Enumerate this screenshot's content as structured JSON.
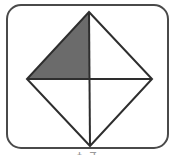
{
  "figure": {
    "canvas": {
      "width": 174,
      "height": 165,
      "background": "#ffffff"
    },
    "frame": {
      "name": "rounded-rectangle-frame",
      "x": 7,
      "y": 5,
      "width": 161,
      "height": 143,
      "corner_radius": 14,
      "stroke_color": "#4a4a4a",
      "stroke_width": 2,
      "fill_color": "#ffffff"
    },
    "diamond": {
      "name": "diamond-outline",
      "stroke_color": "#2e2e2e",
      "stroke_width": 2,
      "fill_color": "#ffffff",
      "vertices": {
        "top": {
          "x": 89,
          "y": 12
        },
        "right": {
          "x": 152,
          "y": 79
        },
        "bottom": {
          "x": 90,
          "y": 146
        },
        "left": {
          "x": 27,
          "y": 79
        }
      },
      "center": {
        "x": 89,
        "y": 79
      }
    },
    "divider_lines": [
      {
        "name": "horizontal-divider",
        "orientation": "horizontal",
        "from": {
          "x": 27,
          "y": 79
        },
        "to": {
          "x": 152,
          "y": 79
        },
        "stroke_color": "#2e2e2e",
        "stroke_width": 2
      },
      {
        "name": "vertical-divider",
        "orientation": "vertical",
        "from": {
          "x": 89,
          "y": 12
        },
        "to": {
          "x": 90,
          "y": 146
        },
        "stroke_color": "#2e2e2e",
        "stroke_width": 2
      }
    ],
    "quadrants": [
      {
        "name": "quadrant-upper-left",
        "position": "upper-left",
        "shaded": true,
        "fill_color": "#6b6b6b",
        "points": "89,12 89,79 27,79"
      },
      {
        "name": "quadrant-upper-right",
        "position": "upper-right",
        "shaded": false,
        "fill_color": "#ffffff",
        "points": "89,12 152,79 89,79"
      },
      {
        "name": "quadrant-lower-right",
        "position": "lower-right",
        "shaded": false,
        "fill_color": "#ffffff",
        "points": "89,79 152,79 90,146"
      },
      {
        "name": "quadrant-lower-left",
        "position": "lower-left",
        "shaded": false,
        "fill_color": "#ffffff",
        "points": "89,79 90,146 27,79"
      }
    ],
    "shading_summary": {
      "total_parts": 4,
      "shaded_parts": 1,
      "fraction": "1/4"
    },
    "caption": {
      "name": "figure-caption",
      "text": "1 4",
      "visible": "partially-cropped",
      "color": "#9a9a9a"
    }
  }
}
